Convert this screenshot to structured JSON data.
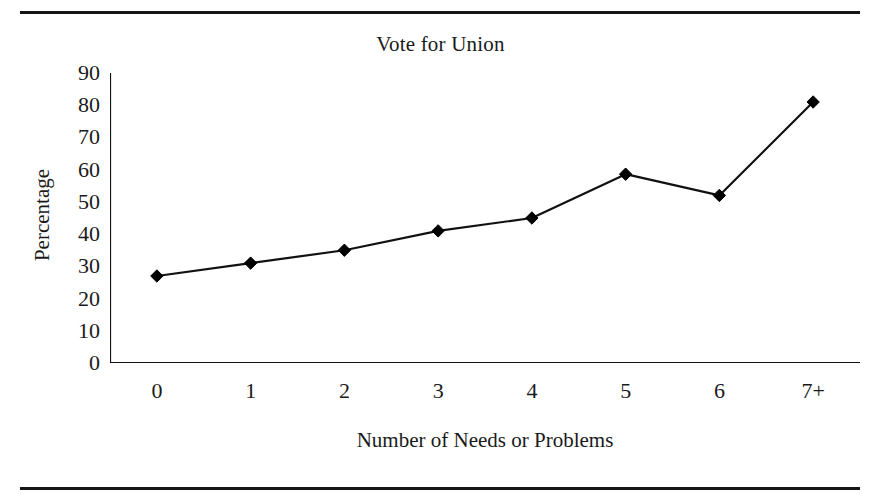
{
  "figure": {
    "name": "vote-for-union-line-chart",
    "rules": {
      "top_label": "",
      "bottom_label": ""
    }
  },
  "chart_data": {
    "type": "line",
    "title": "Vote for Union",
    "xlabel": "Number of Needs or Problems",
    "ylabel": "Percentage",
    "categories": [
      "0",
      "1",
      "2",
      "3",
      "4",
      "5",
      "6",
      "7+"
    ],
    "values": [
      27,
      31,
      35,
      41,
      45,
      58.6,
      52,
      81
    ],
    "ylim": [
      0,
      90
    ],
    "yticks": [
      0,
      10,
      20,
      30,
      40,
      50,
      60,
      70,
      80,
      90
    ],
    "ytick_labels": [
      "0",
      "10",
      "20",
      "30",
      "40",
      "50",
      "60",
      "70",
      "80",
      "90"
    ],
    "grid": false,
    "legend": null,
    "marker": "filled-diamond",
    "line_color": "#111111",
    "marker_color": "#000000",
    "background": "#ffffff"
  }
}
